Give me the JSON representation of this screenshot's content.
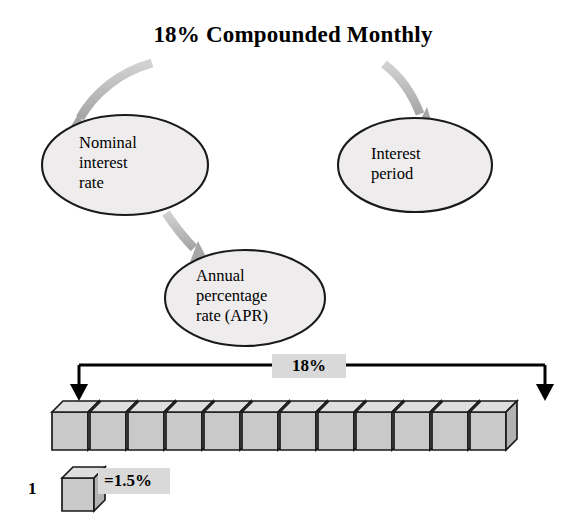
{
  "diagram": {
    "title": "18% Compounded Monthly",
    "nodes": [
      {
        "id": "nominal-interest-rate",
        "label": "Nominal\ninterest\nrate",
        "cx": 125,
        "cy": 165,
        "rx": 83,
        "ry": 50
      },
      {
        "id": "interest-period",
        "label": "Interest\nperiod",
        "cx": 415,
        "cy": 165,
        "rx": 77,
        "ry": 47
      },
      {
        "id": "annual-percentage-rate",
        "label": "Annual\npercentage\nrate (APR)",
        "cx": 245,
        "cy": 298,
        "rx": 80,
        "ry": 48
      }
    ],
    "arrows": [
      {
        "id": "arrow-title-to-nominal",
        "from": "title",
        "to": "nominal-interest-rate"
      },
      {
        "id": "arrow-title-to-period",
        "from": "title",
        "to": "interest-period"
      },
      {
        "id": "arrow-nominal-to-apr",
        "from": "nominal-interest-rate",
        "to": "annual-percentage-rate"
      }
    ],
    "bracket": {
      "label": "18%",
      "left_x": 79,
      "right_x": 545,
      "top_y": 365,
      "arrow_bottom_y": 398
    },
    "boxes": {
      "count": 12,
      "unit_value": "1.5%",
      "first_x": 52,
      "pitch": 38,
      "width": 36,
      "height": 38,
      "depth": 11
    },
    "legend": {
      "count_label": "1",
      "value_label": "=1.5%",
      "icon": "cube-icon"
    },
    "colors": {
      "ellipse_fill": "#eeecec",
      "ellipse_stroke": "#1a1a1a",
      "arrow_gray": "#b3b3b3",
      "box_front": "#c9c9c9",
      "box_top": "#dedede",
      "box_side": "#b2b2b2",
      "box_stroke": "#1a1a1a",
      "highlight_bg": "#d9d9d9",
      "line": "#000000"
    }
  }
}
